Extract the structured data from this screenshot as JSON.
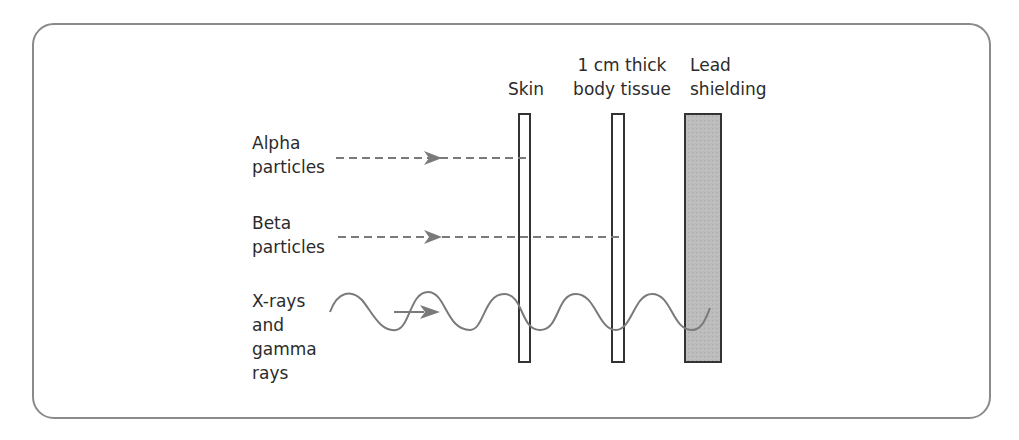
{
  "barriers": [
    {
      "id": "skin",
      "label_lines": [
        "",
        "Skin"
      ]
    },
    {
      "id": "body-tissue",
      "label_lines": [
        "1 cm thick",
        "body tissue"
      ]
    },
    {
      "id": "lead",
      "label_lines": [
        "Lead",
        "shielding"
      ]
    }
  ],
  "radiation": [
    {
      "id": "alpha",
      "label_lines": [
        "Alpha",
        "particles"
      ],
      "stopped_by": "Skin",
      "line_style": "dashed"
    },
    {
      "id": "beta",
      "label_lines": [
        "Beta",
        "particles"
      ],
      "stopped_by": "1 cm thick body tissue",
      "line_style": "dashed"
    },
    {
      "id": "xray-gamma",
      "label_lines": [
        "X-rays",
        "and",
        "gamma",
        "rays"
      ],
      "stopped_by": "Lead shielding",
      "line_style": "wave"
    }
  ],
  "colors": {
    "frame": "#8a8a8a",
    "line": "#7a7a7a",
    "barrier_outline": "#333333",
    "lead_fill": "#b9b9b9",
    "text": "#2b2b2b"
  }
}
